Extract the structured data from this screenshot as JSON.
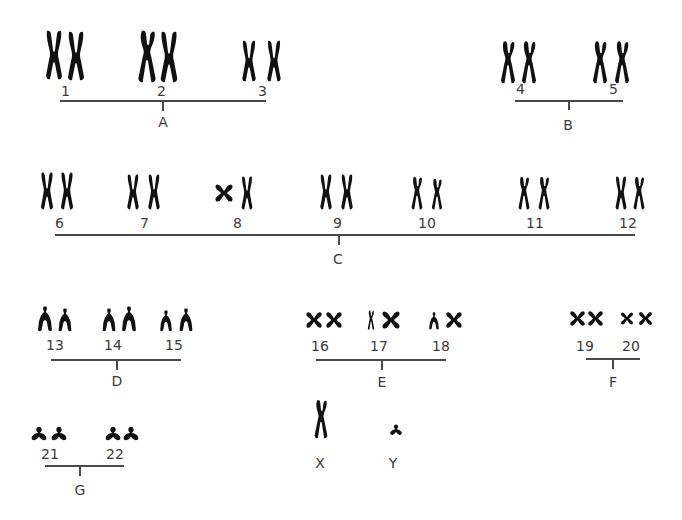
{
  "diagram": {
    "type": "karyotype",
    "ink_color": "#111111",
    "label_color": "#3c3c3c",
    "groups": [
      {
        "id": "A",
        "label": "A",
        "chromosomes": [
          "1",
          "2",
          "3"
        ]
      },
      {
        "id": "B",
        "label": "B",
        "chromosomes": [
          "4",
          "5"
        ]
      },
      {
        "id": "C",
        "label": "C",
        "chromosomes": [
          "6",
          "7",
          "8",
          "9",
          "10",
          "11",
          "12"
        ]
      },
      {
        "id": "D",
        "label": "D",
        "chromosomes": [
          "13",
          "14",
          "15"
        ]
      },
      {
        "id": "E",
        "label": "E",
        "chromosomes": [
          "16",
          "17",
          "18"
        ]
      },
      {
        "id": "F",
        "label": "F",
        "chromosomes": [
          "19",
          "20"
        ]
      },
      {
        "id": "G",
        "label": "G",
        "chromosomes": [
          "21",
          "22"
        ]
      }
    ],
    "sex_chromosomes": [
      {
        "id": "X",
        "label": "X"
      },
      {
        "id": "Y",
        "label": "Y"
      }
    ],
    "labels": {
      "n1": "1",
      "n2": "2",
      "n3": "3",
      "n4": "4",
      "n5": "5",
      "n6": "6",
      "n7": "7",
      "n8": "8",
      "n9": "9",
      "n10": "10",
      "n11": "11",
      "n12": "12",
      "n13": "13",
      "n14": "14",
      "n15": "15",
      "n16": "16",
      "n17": "17",
      "n18": "18",
      "n19": "19",
      "n20": "20",
      "n21": "21",
      "n22": "22",
      "gA": "A",
      "gB": "B",
      "gC": "C",
      "gD": "D",
      "gE": "E",
      "gF": "F",
      "gG": "G",
      "sX": "X",
      "sY": "Y"
    }
  }
}
